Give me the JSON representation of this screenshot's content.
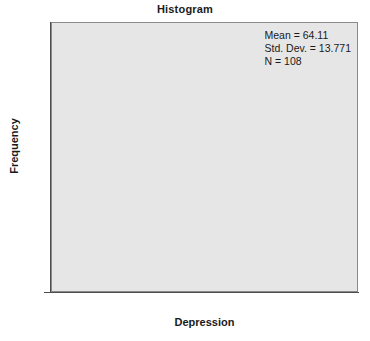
{
  "chart_data": {
    "type": "bar",
    "title": "Histogram",
    "xlabel": "Depression",
    "ylabel": "Frequency",
    "bin_edges": [
      35,
      40,
      45,
      50,
      55,
      60,
      65,
      70,
      75,
      80,
      85,
      90,
      95
    ],
    "bin_centers": [
      37.5,
      42.5,
      47.5,
      52.5,
      57.5,
      62.5,
      67.5,
      72.5,
      77.5,
      82.5,
      87.5,
      92.5
    ],
    "values": [
      2,
      2,
      10,
      17,
      11,
      12,
      18,
      12,
      7,
      6,
      4,
      7
    ],
    "bin_width": 5,
    "xlim": [
      33,
      97
    ],
    "ylim": [
      0,
      21.35
    ],
    "xticks": [
      40,
      50,
      60,
      70,
      80,
      90
    ],
    "xtick_labels": [
      "40",
      "50",
      "60",
      "70",
      "80",
      "90"
    ],
    "yticks": [
      0,
      5,
      10,
      15,
      20
    ],
    "ytick_labels": [
      "0",
      "5",
      "10",
      "15",
      "20"
    ],
    "grid": false,
    "legend": null,
    "bar_fill_color": "#a8a8a8",
    "bar_edge_color": "#6e6e6e",
    "panel_background_color": "#e6e6e6",
    "axis_color": "#4d4d4d"
  },
  "annotation": {
    "mean_line": "Mean = 64.11",
    "stddev_line": "Std. Dev. = 13.771",
    "n_line": "N = 108"
  }
}
